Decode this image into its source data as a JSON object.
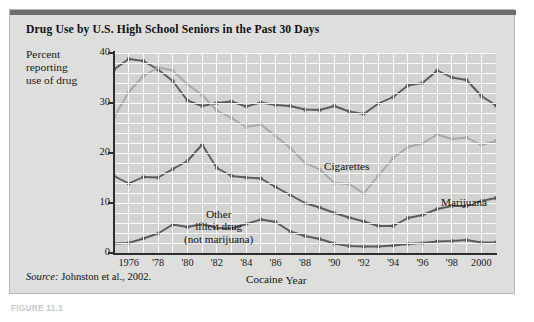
{
  "figure": {
    "title": "Drug Use by U.S. High School Seniors in the Past 30 Days",
    "y_axis_caption": "Percent\nreporting\nuse of drug",
    "source_prefix": "Source:",
    "source_text": " Johnston et al., 2002.",
    "caption_below": "FIGURE 11.1"
  },
  "colors": {
    "card_background": "#dededd",
    "plot_background": "#d2d2d1",
    "grid": "#fbfbfb",
    "axis": "#2f2f2f",
    "top_rule": "#6e6e6e",
    "cigarettes": "#5b5b5b",
    "marijuana": "#a8a8a8",
    "other_illicit": "#5b5b5b",
    "cocaine": "#5b5b5b",
    "text": "#111111"
  },
  "chart_data": {
    "type": "line",
    "title": "Drug Use by U.S. High School Seniors in the Past 30 Days",
    "xlabel": "Year",
    "ylabel": "Percent reporting use of drug",
    "ylim": [
      0,
      40
    ],
    "xlim": [
      1975,
      2001
    ],
    "ytick_values": [
      0,
      10,
      20,
      30,
      40
    ],
    "ytick_labels": [
      "0",
      "10",
      "20",
      "30",
      "40"
    ],
    "xtick_values": [
      1976,
      1978,
      1980,
      1982,
      1984,
      1986,
      1988,
      1990,
      1992,
      1994,
      1996,
      1998,
      2000
    ],
    "xtick_labels": [
      "1976",
      "'78",
      "'80",
      "'82",
      "'84",
      "'86",
      "'88",
      "'90",
      "'92",
      "'94",
      "'96",
      "'98",
      "2000"
    ],
    "grid": true,
    "legend_position": "inline-annotations",
    "x": [
      1975,
      1976,
      1977,
      1978,
      1979,
      1980,
      1981,
      1982,
      1983,
      1984,
      1985,
      1986,
      1987,
      1988,
      1989,
      1990,
      1991,
      1992,
      1993,
      1994,
      1995,
      1996,
      1997,
      1998,
      1999,
      2000,
      2001
    ],
    "series": [
      {
        "name": "Cigarettes",
        "label": "Cigarettes",
        "color": "#5b5b5b",
        "values": [
          36.7,
          38.8,
          38.4,
          36.7,
          34.4,
          30.5,
          29.4,
          30.0,
          30.3,
          29.3,
          30.1,
          29.6,
          29.4,
          28.7,
          28.6,
          29.4,
          28.3,
          27.8,
          29.9,
          31.2,
          33.5,
          34.0,
          36.5,
          35.1,
          34.6,
          31.4,
          29.5
        ]
      },
      {
        "name": "Marijuana",
        "label": "Marijuana",
        "color": "#a8a8a8",
        "values": [
          27.1,
          32.2,
          35.4,
          37.1,
          36.5,
          33.7,
          31.6,
          28.5,
          27.0,
          25.2,
          25.7,
          23.4,
          21.0,
          18.0,
          16.7,
          14.0,
          13.8,
          11.9,
          15.5,
          19.0,
          21.2,
          21.9,
          23.7,
          22.8,
          23.1,
          21.6,
          22.4
        ]
      },
      {
        "name": "Other illicit drug (not marijuana)",
        "label": "Other\nillicit drug\n(not marijuana)",
        "color": "#5b5b5b",
        "values": [
          15.4,
          13.9,
          15.2,
          15.1,
          16.8,
          18.4,
          21.7,
          17.0,
          15.4,
          15.1,
          14.9,
          13.2,
          11.6,
          10.0,
          9.1,
          8.0,
          7.1,
          6.3,
          5.4,
          5.4,
          7.0,
          7.6,
          8.8,
          9.4,
          9.4,
          10.4,
          11.0
        ]
      },
      {
        "name": "Cocaine",
        "label": "Cocaine",
        "color": "#5b5b5b",
        "values": [
          1.9,
          2.0,
          2.9,
          3.9,
          5.7,
          5.2,
          5.8,
          5.0,
          4.9,
          5.8,
          6.7,
          6.2,
          4.3,
          3.4,
          2.8,
          1.9,
          1.4,
          1.3,
          1.3,
          1.5,
          1.8,
          2.0,
          2.3,
          2.4,
          2.6,
          2.1,
          2.1
        ]
      }
    ]
  }
}
